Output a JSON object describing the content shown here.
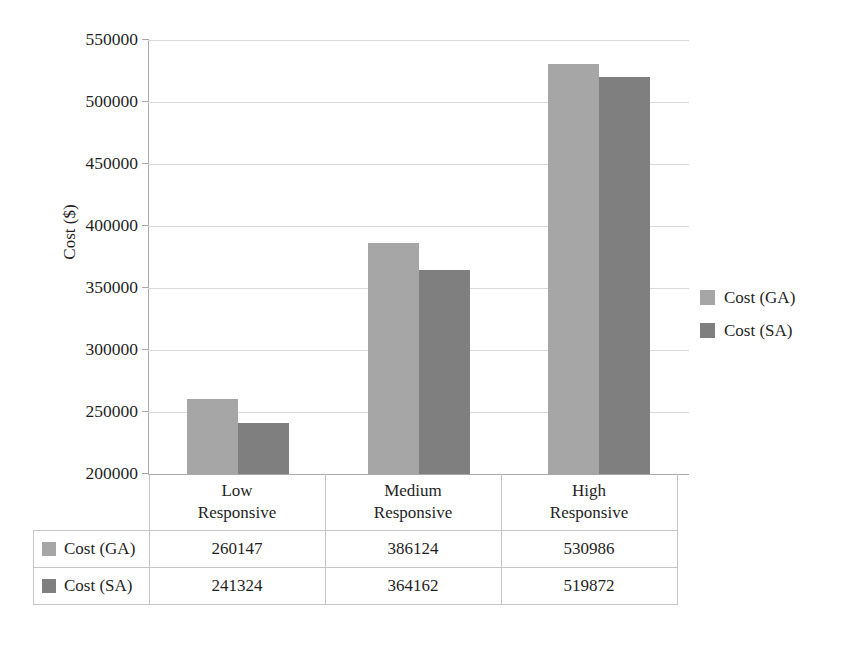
{
  "chart_data": {
    "type": "bar",
    "title": "",
    "subtitle": "",
    "xlabel": "",
    "ylabel": "Cost ($)",
    "categories": [
      "Low Responsive",
      "Medium Responsive",
      "High Responsive"
    ],
    "category_lines": [
      [
        "Low",
        "Responsive"
      ],
      [
        "Medium",
        "Responsive"
      ],
      [
        "High",
        "Responsive"
      ]
    ],
    "series": [
      {
        "name": "Cost (GA)",
        "values": [
          260147,
          386124,
          530986
        ],
        "color": "#a6a6a6"
      },
      {
        "name": "Cost (SA)",
        "values": [
          241324,
          364162,
          519872
        ],
        "color": "#7f7f7f"
      }
    ],
    "ylim": [
      200000,
      550000
    ],
    "ytick_step": 50000,
    "yticks": [
      550000,
      500000,
      450000,
      400000,
      350000,
      300000,
      250000,
      200000
    ],
    "ytick_labels": [
      "550000",
      "500000",
      "450000",
      "400000",
      "350000",
      "300000",
      "250000",
      "200000"
    ],
    "grid": true,
    "grid_axis": "y",
    "legend_position": "right",
    "data_table_visible": true,
    "bar_gap_within_group": 0,
    "colors": {
      "series_ga": "#a6a6a6",
      "series_sa": "#7f7f7f",
      "gridline": "#d9d9d9",
      "axis": "#a9a9a9",
      "table_border": "#c4c4c4",
      "text": "#1f1f1f",
      "background": "#ffffff"
    }
  },
  "legend": {
    "items": [
      {
        "label": "Cost (GA)",
        "color": "#a6a6a6"
      },
      {
        "label": "Cost (SA)",
        "color": "#7f7f7f"
      }
    ]
  },
  "data_table": {
    "row_header_column": "",
    "column_headers": [
      "Low Responsive",
      "Medium Responsive",
      "High Responsive"
    ],
    "rows": [
      {
        "name": "Cost (GA)",
        "color": "#a6a6a6",
        "cells": [
          "260147",
          "386124",
          "530986"
        ]
      },
      {
        "name": "Cost (SA)",
        "color": "#7f7f7f",
        "cells": [
          "241324",
          "364162",
          "519872"
        ]
      }
    ]
  }
}
